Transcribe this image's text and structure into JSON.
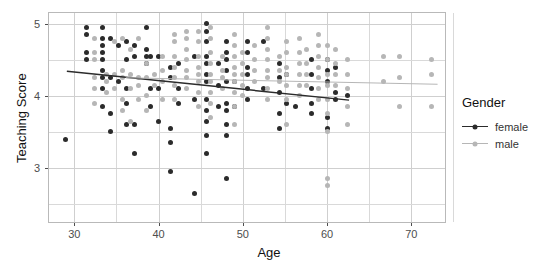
{
  "chart_data": {
    "type": "scatter",
    "title": "",
    "xlabel": "Age",
    "ylabel": "Teaching Score",
    "xlim": [
      27,
      74
    ],
    "ylim": [
      2.25,
      5.15
    ],
    "xticks": [
      30,
      40,
      50,
      60,
      70
    ],
    "yticks": [
      3,
      4,
      5
    ],
    "grid": true,
    "legend": {
      "title": "Gender",
      "position": "right",
      "entries": [
        {
          "label": "female",
          "color": "#2b2b2b"
        },
        {
          "label": "male",
          "color": "#b6b6b6"
        }
      ]
    },
    "fit_lines": [
      {
        "name": "female",
        "color": "#2b2b2b",
        "x": [
          29.0,
          62.5
        ],
        "y": [
          4.355,
          3.955
        ]
      },
      {
        "name": "male",
        "color": "#b6b6b6",
        "x": [
          36.0,
          73.0
        ],
        "y": [
          4.265,
          4.175
        ]
      }
    ],
    "series": [
      {
        "name": "female",
        "color": "#2b2b2b",
        "points": [
          [
            29.0,
            3.4
          ],
          [
            31.4,
            4.95
          ],
          [
            31.4,
            4.85
          ],
          [
            31.4,
            4.6
          ],
          [
            31.4,
            4.5
          ],
          [
            33.3,
            4.95
          ],
          [
            33.3,
            4.8
          ],
          [
            33.3,
            4.7
          ],
          [
            33.3,
            4.6
          ],
          [
            33.3,
            4.5
          ],
          [
            33.3,
            4.35
          ],
          [
            33.3,
            4.25
          ],
          [
            33.3,
            4.1
          ],
          [
            33.3,
            3.85
          ],
          [
            34.3,
            4.8
          ],
          [
            34.3,
            4.25
          ],
          [
            34.3,
            3.75
          ],
          [
            34.3,
            3.5
          ],
          [
            35.2,
            4.7
          ],
          [
            35.2,
            4.2
          ],
          [
            36.2,
            4.75
          ],
          [
            36.2,
            4.5
          ],
          [
            36.2,
            4.1
          ],
          [
            36.2,
            3.9
          ],
          [
            36.2,
            3.6
          ],
          [
            37.1,
            4.7
          ],
          [
            37.1,
            4.55
          ],
          [
            37.1,
            3.6
          ],
          [
            37.1,
            3.2
          ],
          [
            38.6,
            4.95
          ],
          [
            38.6,
            4.65
          ],
          [
            38.6,
            4.55
          ],
          [
            38.6,
            4.45
          ],
          [
            39.0,
            4.55
          ],
          [
            39.0,
            4.1
          ],
          [
            39.0,
            3.85
          ],
          [
            40.0,
            4.55
          ],
          [
            40.0,
            4.1
          ],
          [
            40.0,
            3.65
          ],
          [
            41.4,
            4.4
          ],
          [
            41.4,
            4.25
          ],
          [
            41.4,
            3.55
          ],
          [
            41.4,
            3.35
          ],
          [
            41.4,
            2.95
          ],
          [
            42.4,
            4.45
          ],
          [
            42.4,
            4.1
          ],
          [
            42.4,
            3.9
          ],
          [
            44.3,
            4.55
          ],
          [
            44.3,
            3.95
          ],
          [
            44.3,
            2.65
          ],
          [
            45.7,
            5.0
          ],
          [
            45.7,
            4.9
          ],
          [
            45.7,
            4.75
          ],
          [
            45.7,
            4.55
          ],
          [
            45.7,
            4.45
          ],
          [
            45.7,
            4.3
          ],
          [
            45.7,
            4.2
          ],
          [
            45.7,
            3.95
          ],
          [
            45.7,
            3.8
          ],
          [
            45.7,
            3.65
          ],
          [
            45.7,
            3.45
          ],
          [
            45.7,
            3.2
          ],
          [
            47.1,
            4.45
          ],
          [
            47.1,
            4.15
          ],
          [
            47.1,
            3.85
          ],
          [
            48.1,
            4.75
          ],
          [
            48.1,
            4.6
          ],
          [
            48.1,
            4.5
          ],
          [
            48.1,
            4.35
          ],
          [
            48.1,
            4.2
          ],
          [
            48.1,
            3.9
          ],
          [
            48.1,
            3.8
          ],
          [
            48.1,
            3.6
          ],
          [
            48.1,
            3.45
          ],
          [
            48.1,
            2.85
          ],
          [
            49.0,
            4.2
          ],
          [
            49.0,
            3.85
          ],
          [
            50.5,
            4.75
          ],
          [
            50.5,
            4.6
          ],
          [
            50.5,
            4.4
          ],
          [
            50.5,
            4.3
          ],
          [
            50.5,
            4.1
          ],
          [
            50.5,
            3.95
          ],
          [
            52.4,
            4.75
          ],
          [
            52.4,
            4.1
          ],
          [
            54.3,
            4.45
          ],
          [
            54.3,
            4.25
          ],
          [
            54.3,
            4.05
          ],
          [
            54.3,
            3.75
          ],
          [
            54.3,
            3.55
          ],
          [
            55.2,
            4.3
          ],
          [
            55.2,
            3.9
          ],
          [
            56.2,
            3.85
          ],
          [
            58.1,
            4.5
          ],
          [
            58.1,
            4.3
          ],
          [
            58.1,
            4.1
          ],
          [
            58.1,
            3.9
          ],
          [
            58.1,
            3.75
          ],
          [
            60.0,
            4.5
          ],
          [
            60.0,
            4.35
          ],
          [
            60.0,
            4.2
          ],
          [
            60.0,
            3.7
          ],
          [
            60.0,
            3.55
          ],
          [
            61.0,
            4.4
          ],
          [
            61.0,
            4.05
          ],
          [
            61.0,
            3.95
          ],
          [
            62.4,
            4.0
          ]
        ]
      },
      {
        "name": "male",
        "color": "#b6b6b6",
        "points": [
          [
            32.4,
            4.8
          ],
          [
            32.4,
            4.6
          ],
          [
            32.4,
            4.5
          ],
          [
            32.4,
            4.25
          ],
          [
            32.4,
            4.1
          ],
          [
            32.4,
            3.9
          ],
          [
            33.8,
            4.3
          ],
          [
            33.8,
            4.2
          ],
          [
            33.8,
            4.05
          ],
          [
            34.8,
            4.75
          ],
          [
            34.8,
            4.3
          ],
          [
            34.8,
            4.1
          ],
          [
            35.7,
            4.8
          ],
          [
            35.7,
            4.35
          ],
          [
            35.7,
            4.25
          ],
          [
            35.7,
            3.95
          ],
          [
            35.7,
            3.8
          ],
          [
            36.7,
            4.65
          ],
          [
            36.7,
            4.3
          ],
          [
            36.7,
            4.1
          ],
          [
            36.7,
            3.65
          ],
          [
            37.6,
            4.8
          ],
          [
            37.6,
            4.25
          ],
          [
            37.6,
            4.15
          ],
          [
            37.6,
            3.95
          ],
          [
            38.6,
            4.45
          ],
          [
            38.6,
            4.25
          ],
          [
            38.6,
            4.0
          ],
          [
            38.6,
            3.8
          ],
          [
            39.5,
            4.3
          ],
          [
            39.5,
            4.15
          ],
          [
            40.5,
            4.55
          ],
          [
            40.5,
            4.35
          ],
          [
            40.5,
            4.2
          ],
          [
            40.5,
            3.95
          ],
          [
            41.9,
            4.85
          ],
          [
            41.9,
            4.75
          ],
          [
            41.9,
            4.55
          ],
          [
            41.9,
            4.4
          ],
          [
            41.9,
            4.25
          ],
          [
            41.9,
            4.15
          ],
          [
            41.9,
            3.95
          ],
          [
            43.3,
            4.9
          ],
          [
            43.3,
            4.8
          ],
          [
            43.3,
            4.65
          ],
          [
            43.3,
            4.5
          ],
          [
            43.3,
            4.35
          ],
          [
            43.3,
            4.25
          ],
          [
            43.3,
            4.1
          ],
          [
            44.8,
            4.9
          ],
          [
            44.8,
            4.75
          ],
          [
            44.8,
            4.55
          ],
          [
            44.8,
            4.4
          ],
          [
            44.8,
            4.3
          ],
          [
            44.8,
            4.2
          ],
          [
            44.8,
            4.05
          ],
          [
            44.8,
            3.85
          ],
          [
            46.2,
            4.95
          ],
          [
            46.2,
            4.8
          ],
          [
            46.2,
            4.6
          ],
          [
            46.2,
            4.45
          ],
          [
            46.2,
            4.3
          ],
          [
            46.2,
            4.2
          ],
          [
            46.2,
            4.05
          ],
          [
            46.2,
            3.9
          ],
          [
            46.2,
            3.7
          ],
          [
            47.6,
            4.55
          ],
          [
            47.6,
            4.35
          ],
          [
            47.6,
            4.25
          ],
          [
            47.6,
            4.1
          ],
          [
            49.0,
            4.85
          ],
          [
            49.0,
            4.7
          ],
          [
            49.0,
            4.55
          ],
          [
            49.0,
            4.4
          ],
          [
            49.0,
            4.3
          ],
          [
            49.0,
            4.2
          ],
          [
            49.0,
            4.05
          ],
          [
            49.0,
            3.85
          ],
          [
            49.0,
            3.6
          ],
          [
            50.0,
            4.6
          ],
          [
            50.0,
            4.45
          ],
          [
            50.0,
            4.3
          ],
          [
            50.0,
            4.15
          ],
          [
            50.0,
            4.0
          ],
          [
            51.4,
            4.7
          ],
          [
            51.4,
            4.5
          ],
          [
            51.4,
            4.35
          ],
          [
            51.4,
            4.2
          ],
          [
            52.9,
            4.95
          ],
          [
            52.9,
            4.8
          ],
          [
            52.9,
            4.65
          ],
          [
            52.9,
            4.5
          ],
          [
            52.9,
            4.35
          ],
          [
            52.9,
            4.25
          ],
          [
            52.9,
            4.1
          ],
          [
            52.9,
            3.95
          ],
          [
            54.3,
            4.55
          ],
          [
            54.3,
            4.35
          ],
          [
            54.3,
            4.2
          ],
          [
            55.2,
            4.75
          ],
          [
            55.2,
            4.6
          ],
          [
            55.2,
            4.4
          ],
          [
            55.2,
            4.3
          ],
          [
            55.2,
            4.15
          ],
          [
            55.2,
            3.95
          ],
          [
            55.2,
            3.6
          ],
          [
            56.7,
            4.8
          ],
          [
            56.7,
            4.6
          ],
          [
            56.7,
            4.45
          ],
          [
            56.7,
            4.3
          ],
          [
            56.7,
            4.15
          ],
          [
            56.7,
            4.0
          ],
          [
            57.6,
            4.65
          ],
          [
            57.6,
            4.45
          ],
          [
            57.6,
            4.3
          ],
          [
            57.6,
            4.15
          ],
          [
            59.0,
            4.85
          ],
          [
            59.0,
            4.7
          ],
          [
            59.0,
            4.55
          ],
          [
            59.0,
            4.4
          ],
          [
            59.0,
            4.25
          ],
          [
            59.0,
            4.1
          ],
          [
            59.0,
            3.95
          ],
          [
            60.0,
            4.7
          ],
          [
            60.0,
            4.5
          ],
          [
            60.0,
            4.3
          ],
          [
            60.0,
            4.15
          ],
          [
            60.0,
            3.95
          ],
          [
            60.0,
            3.75
          ],
          [
            60.0,
            3.5
          ],
          [
            60.0,
            2.85
          ],
          [
            60.0,
            2.75
          ],
          [
            61.0,
            4.65
          ],
          [
            61.0,
            4.45
          ],
          [
            61.0,
            4.3
          ],
          [
            61.0,
            4.15
          ],
          [
            62.4,
            4.5
          ],
          [
            62.4,
            4.3
          ],
          [
            62.4,
            4.1
          ],
          [
            62.4,
            3.85
          ],
          [
            62.4,
            3.6
          ],
          [
            66.7,
            4.55
          ],
          [
            66.7,
            4.2
          ],
          [
            68.6,
            4.55
          ],
          [
            68.6,
            4.25
          ],
          [
            68.6,
            3.85
          ],
          [
            72.4,
            4.5
          ],
          [
            72.4,
            4.3
          ],
          [
            72.4,
            3.85
          ]
        ]
      }
    ]
  }
}
